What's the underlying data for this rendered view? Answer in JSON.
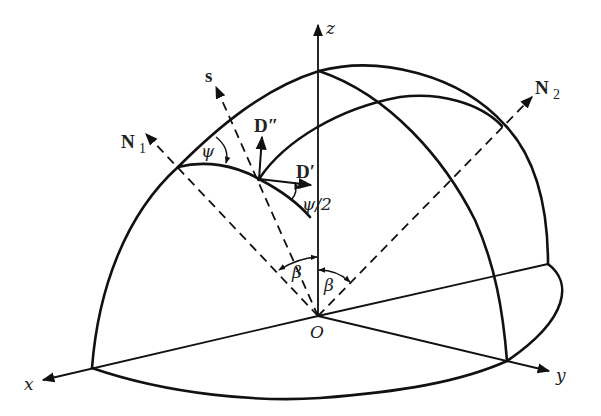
{
  "diagram": {
    "type": "3D spherical geometry figure",
    "axes": {
      "z": "z",
      "x": "x",
      "y": "y",
      "origin": "O"
    },
    "vectors": {
      "s": "s",
      "n1": "N",
      "n1_sub": "1",
      "n2": "N",
      "n2_sub": "2",
      "d_double_prime": "D″",
      "d_prime": "D′"
    },
    "angles": {
      "psi": "ψ",
      "psi_half": "ψ/2",
      "beta_left": "β",
      "beta_right": "β"
    },
    "colors": {
      "stroke": "#111111",
      "background": "#ffffff"
    }
  }
}
